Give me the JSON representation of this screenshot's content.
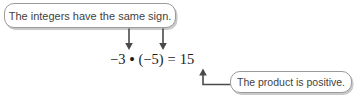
{
  "diagram": {
    "top_callout": {
      "text": "The integers have the same sign."
    },
    "bottom_callout": {
      "text": "The product is positive."
    },
    "equation": {
      "factor1": "−3",
      "operator": "•",
      "factor2": "(−5)",
      "equals": "=",
      "product": "15"
    }
  },
  "colors": {
    "callout_border": "#9b9b9b",
    "callout_shadow": "#c9c9c9",
    "callout_text": "#3f3f3f",
    "arrow": "#4a4a4a",
    "equation_text": "#1c1c1c",
    "background": "#ffffff"
  }
}
